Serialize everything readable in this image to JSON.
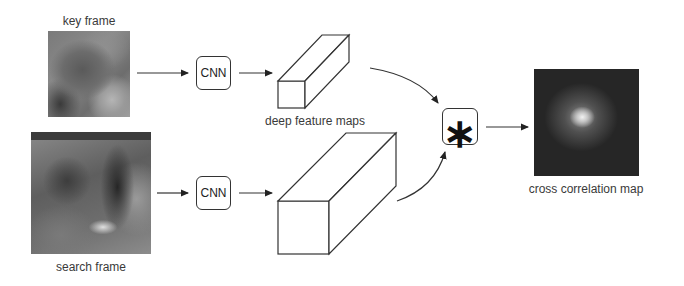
{
  "diagram": {
    "inputs": {
      "key_frame": {
        "label": "key frame",
        "image": "grayscale-key-frame-patch"
      },
      "search_frame": {
        "label": "search frame",
        "image": "grayscale-search-frame-patch"
      }
    },
    "nodes": {
      "cnn_top": {
        "label": "CNN"
      },
      "cnn_bottom": {
        "label": "CNN"
      },
      "features_label": "deep feature maps",
      "operator": {
        "symbol": "∗",
        "name": "cross-correlation"
      },
      "output": {
        "label": "cross correlation map",
        "image": "grayscale-heatmap-peak-center"
      }
    },
    "edges": [
      {
        "from": "key frame",
        "to": "CNN (top)"
      },
      {
        "from": "CNN (top)",
        "to": "deep feature map (small)"
      },
      {
        "from": "search frame",
        "to": "CNN (bottom)"
      },
      {
        "from": "CNN (bottom)",
        "to": "deep feature map (large)"
      },
      {
        "from": "deep feature map (small)",
        "to": "∗"
      },
      {
        "from": "deep feature map (large)",
        "to": "∗"
      },
      {
        "from": "∗",
        "to": "cross correlation map"
      }
    ],
    "colors": {
      "stroke": "#333333",
      "background": "#ffffff"
    }
  }
}
